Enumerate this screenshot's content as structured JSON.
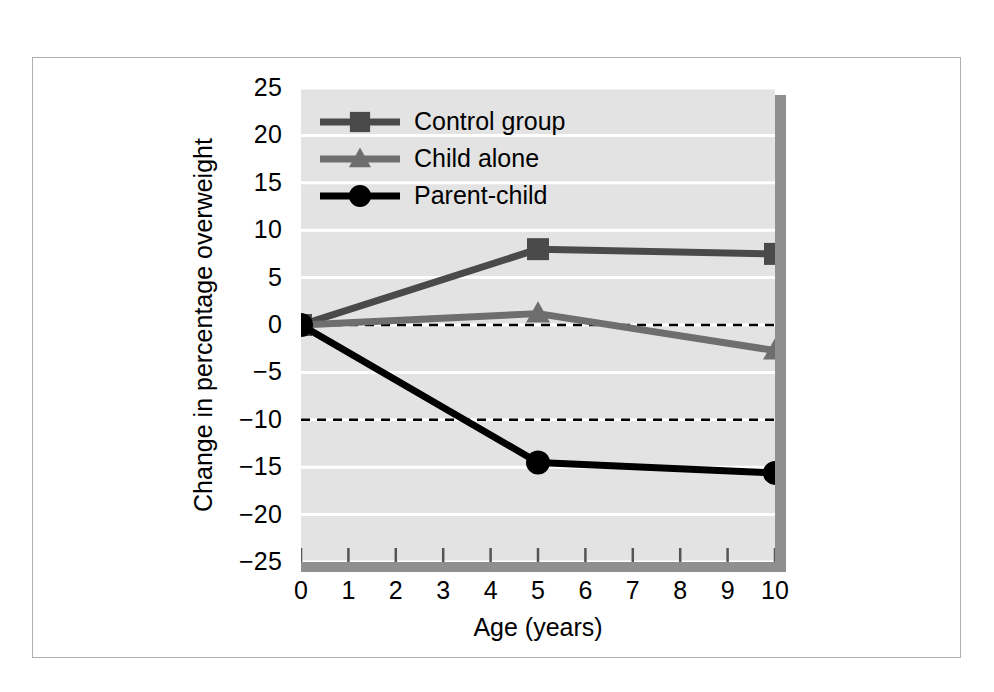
{
  "figure": {
    "background_color": "#ffffff",
    "frame_color": "#b0b0b0",
    "plot_background_color": "#e3e3e3",
    "gridline_color": "#ffffff",
    "shadow_color": "#8f8f8f"
  },
  "chart_data": {
    "type": "line",
    "title": "",
    "subtitle": "",
    "xlabel": "Age (years)",
    "ylabel": "Change in percentage overweight",
    "x": [
      0,
      5,
      10
    ],
    "xlim": [
      0,
      10
    ],
    "ylim": [
      -25,
      25
    ],
    "xticks": [
      0,
      1,
      2,
      3,
      4,
      5,
      6,
      7,
      8,
      9,
      10
    ],
    "xtick_labels": [
      "0",
      "1",
      "2",
      "3",
      "4",
      "5",
      "6",
      "7",
      "8",
      "9",
      "10"
    ],
    "yticks": [
      25,
      20,
      15,
      10,
      5,
      0,
      -5,
      -10,
      -15,
      -20,
      -25
    ],
    "ytick_labels": [
      "25",
      "20",
      "15",
      "10",
      "5",
      "0",
      "−5",
      "−10",
      "−15",
      "−20",
      "−25"
    ],
    "grid": "horizontal",
    "legend_position": "upper-left-inside",
    "reference_lines": [
      {
        "name": "zero-line",
        "y": 0,
        "style": "dashed",
        "color": "#000000"
      },
      {
        "name": "minus-ten-line",
        "y": -10,
        "style": "dashed",
        "color": "#000000"
      }
    ],
    "series": [
      {
        "name": "Control group",
        "values": [
          0,
          8.0,
          7.5
        ],
        "color": "#4a4a4a",
        "marker": "square"
      },
      {
        "name": "Child alone",
        "values": [
          0,
          1.2,
          -2.7
        ],
        "color": "#6e6e6e",
        "marker": "triangle"
      },
      {
        "name": "Parent-child",
        "values": [
          0,
          -14.5,
          -15.6
        ],
        "color": "#000000",
        "marker": "circle"
      }
    ]
  },
  "legend": {
    "entries": [
      {
        "label": "Control group",
        "color": "#4a4a4a",
        "marker": "square"
      },
      {
        "label": "Child alone",
        "color": "#6e6e6e",
        "marker": "triangle"
      },
      {
        "label": "Parent-child",
        "color": "#000000",
        "marker": "circle"
      }
    ]
  }
}
